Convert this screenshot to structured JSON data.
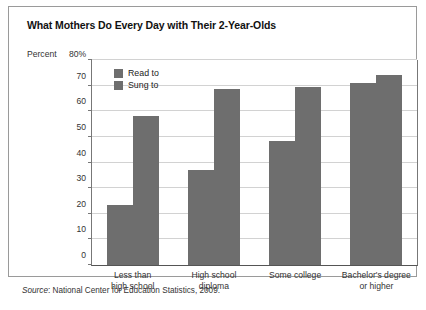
{
  "chart_data": {
    "type": "bar",
    "title": "What Mothers Do Every Day with Their 2-Year-Olds",
    "xlabel": "",
    "ylabel": "Percent",
    "y_axis_top_label": "80%",
    "ylim": [
      0,
      80
    ],
    "yticks": [
      0,
      10,
      20,
      30,
      40,
      50,
      60,
      70,
      80
    ],
    "ytick_labels": [
      "0",
      "10",
      "20",
      "30",
      "40",
      "50",
      "60",
      "70",
      "80%"
    ],
    "grid": true,
    "legend_position": "top-left-inside",
    "categories": [
      "Less than high school",
      "High school diploma",
      "Some college",
      "Bachelor's degree or higher"
    ],
    "category_lines": [
      [
        "Less than",
        "high school"
      ],
      [
        "High school",
        "diploma"
      ],
      [
        "Some college",
        ""
      ],
      [
        "Bachelor's degree",
        "or higher"
      ]
    ],
    "series": [
      {
        "name": "Read to",
        "color": "#6e6e6e",
        "values": [
          23.5,
          37,
          48.5,
          71
        ]
      },
      {
        "name": "Sung to",
        "color": "#6e6e6e",
        "values": [
          58,
          68.5,
          69.5,
          74
        ]
      }
    ],
    "source": {
      "label": "Source",
      "text": ": National Center for Education Statistics, 2009."
    }
  }
}
